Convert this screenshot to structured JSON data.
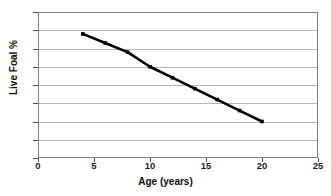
{
  "chart_data": {
    "type": "line",
    "title": "",
    "xlabel": "Age (years)",
    "ylabel": "Live Foal %",
    "xlim": [
      0,
      25
    ],
    "ylim": [
      40,
      80
    ],
    "xticks": [
      0,
      5,
      10,
      15,
      20,
      25
    ],
    "yticks": [
      40,
      45,
      50,
      55,
      60,
      65,
      70,
      75,
      80
    ],
    "xtick_labels": [
      "0",
      "5",
      "10",
      "15",
      "20",
      "25"
    ],
    "ytick_labels": [
      "40",
      "45",
      "50",
      "55",
      "60",
      "65",
      "70",
      "75",
      "80"
    ],
    "grid": "horizontal",
    "legend": "none",
    "series": [
      {
        "name": "Live Foal %",
        "color": "#000000",
        "marker": "square",
        "x": [
          4,
          6,
          8,
          10,
          12,
          14,
          16,
          18,
          20
        ],
        "values": [
          74,
          71.5,
          69,
          65,
          62,
          59,
          56,
          53,
          50
        ]
      }
    ]
  },
  "axes": {
    "x_title": "Age (years)",
    "y_title": "Live Foal %"
  }
}
